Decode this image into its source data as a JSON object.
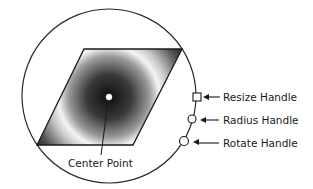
{
  "diagram": {
    "type": "gradient-tool-handles",
    "labels": {
      "center_point": "Center Point",
      "resize_handle": "Resize Handle",
      "radius_handle": "Radius Handle",
      "rotate_handle": "Rotate Handle"
    },
    "colors": {
      "outline": "#2a2a2a",
      "gradient_center": "#111111",
      "gradient_ring": "#f2f2f2",
      "gradient_edge": "#1e1e1e",
      "background": "#ffffff"
    },
    "handles": [
      {
        "name": "resize-handle",
        "shape": "square"
      },
      {
        "name": "radius-handle",
        "shape": "circle"
      },
      {
        "name": "rotate-handle",
        "shape": "circle"
      }
    ]
  }
}
